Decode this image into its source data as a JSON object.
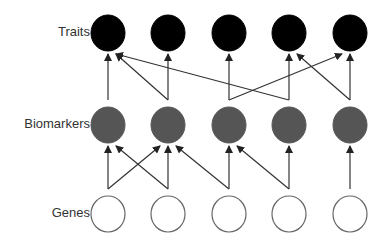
{
  "rows": [
    {
      "label": "Traits",
      "y": 33,
      "fill": "#000000",
      "stroke": "#000000"
    },
    {
      "label": "Biomarkers",
      "y": 125,
      "fill": "#555555",
      "stroke": "#555555"
    },
    {
      "label": "Genes",
      "y": 214,
      "fill": "#ffffff",
      "stroke": "#666666"
    }
  ],
  "node_x": [
    108,
    168,
    229,
    289,
    350
  ],
  "node_radius": 17,
  "edges": {
    "biomarkers_to_traits": [
      [
        0,
        0
      ],
      [
        1,
        0
      ],
      [
        1,
        1
      ],
      [
        3,
        0
      ],
      [
        2,
        2
      ],
      [
        2,
        4
      ],
      [
        3,
        3
      ],
      [
        4,
        3
      ],
      [
        4,
        4
      ]
    ],
    "genes_to_biomarkers": [
      [
        0,
        0
      ],
      [
        0,
        1
      ],
      [
        1,
        0
      ],
      [
        1,
        1
      ],
      [
        2,
        1
      ],
      [
        2,
        2
      ],
      [
        3,
        2
      ],
      [
        3,
        3
      ],
      [
        4,
        4
      ]
    ]
  },
  "colors": {
    "arrow": "#333333"
  }
}
